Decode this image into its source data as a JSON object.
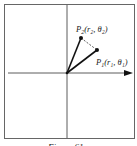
{
  "figure": {
    "caption": "Figure 61",
    "points": {
      "p1": {
        "label": "P",
        "sub": "1",
        "coords": "(r₁, θ₁)",
        "x": 97,
        "y": 50
      },
      "p2": {
        "label": "P",
        "sub": "2",
        "coords": "(r₂, θ₂)",
        "x": 81,
        "y": 38
      }
    },
    "origin": {
      "x": 67,
      "y": 73
    },
    "colors": {
      "line": "#1a1a1a",
      "frame": "#555555",
      "dashed": "#333333"
    }
  }
}
